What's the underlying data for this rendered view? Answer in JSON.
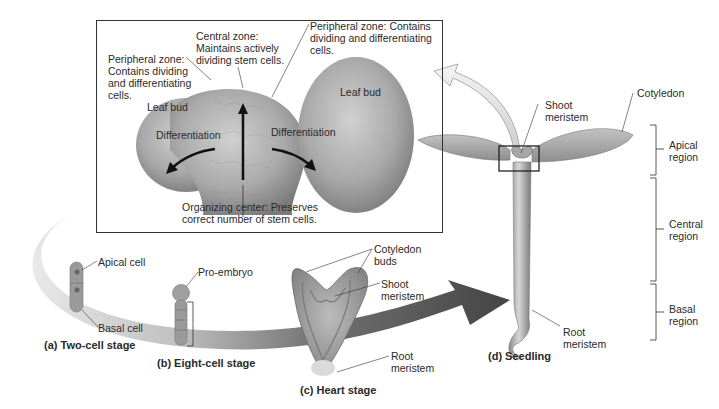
{
  "inset": {
    "central_zone": [
      "Central zone:",
      "Maintains actively",
      "dividing stem cells."
    ],
    "peripheral_zone_left": [
      "Peripheral zone:",
      "Contains dividing",
      "and differentiating",
      "cells."
    ],
    "peripheral_zone_right": [
      "Peripheral zone: Contains",
      "dividing and differentiating",
      "cells."
    ],
    "leaf_bud_left": "Leaf bud",
    "leaf_bud_right": "Leaf bud",
    "differentiation_left": "Differentiation",
    "differentiation_right": "Differentiation",
    "organizing_center": [
      "Organizing center: Preserves",
      "correct number of stem cells."
    ]
  },
  "stages": {
    "a": {
      "caption": "(a) Two-cell stage",
      "labels": [
        "Apical cell",
        "Basal cell"
      ]
    },
    "b": {
      "caption": "(b) Eight-cell stage",
      "labels": [
        "Pro-embryo"
      ],
      "suspensor": "Suspensor"
    },
    "c": {
      "caption": "(c) Heart stage",
      "labels": [
        [
          "Cotyledon",
          "buds"
        ],
        [
          "Shoot",
          "meristem"
        ],
        [
          "Root",
          "meristem"
        ]
      ]
    },
    "d": {
      "caption": "(d) Seedling",
      "labels": [
        [
          "Shoot",
          "meristem"
        ],
        [
          "Cotyledon"
        ],
        [
          "Root",
          "meristem"
        ]
      ]
    }
  },
  "regions": [
    [
      "Apical",
      "region"
    ],
    [
      "Central",
      "region"
    ],
    [
      "Basal",
      "region"
    ]
  ],
  "colors": {
    "tissue": "#a8a8a8",
    "band_dark": "#3a3a3a",
    "band_light": "#d8d8d8",
    "line": "#333333"
  }
}
